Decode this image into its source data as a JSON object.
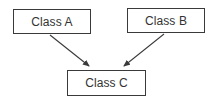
{
  "diagram": {
    "type": "class-inheritance",
    "nodes": [
      {
        "id": "A",
        "label": "Class A"
      },
      {
        "id": "B",
        "label": "Class B"
      },
      {
        "id": "C",
        "label": "Class C"
      }
    ],
    "edges": [
      {
        "from": "A",
        "to": "C",
        "style": "arrow"
      },
      {
        "from": "B",
        "to": "C",
        "style": "arrow"
      }
    ],
    "colors": {
      "stroke": "#3a3a3a",
      "text": "#333333",
      "background": "#ffffff"
    }
  }
}
